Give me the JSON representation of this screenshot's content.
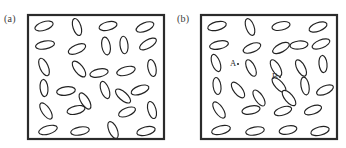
{
  "figure": {
    "type": "scientific-illustration",
    "background_color": "#ffffff",
    "frame_color": "#2b2b2b",
    "particle_fill": "#ffffff",
    "particle_stroke": "#222222",
    "label_color": "#3a3a3a"
  },
  "panels": [
    {
      "id": "a",
      "label": "(a)",
      "frame": {
        "x": 28,
        "y": 15,
        "width": 136,
        "height": 124
      },
      "particle_count": 28,
      "particles": [
        {
          "cx": 44,
          "cy": 26,
          "rx": 9.5,
          "ry": 4.2,
          "angle": -18
        },
        {
          "cx": 77,
          "cy": 27,
          "rx": 8.8,
          "ry": 4.0,
          "angle": 72
        },
        {
          "cx": 108,
          "cy": 26,
          "rx": 9.2,
          "ry": 4.1,
          "angle": -14
        },
        {
          "cx": 145,
          "cy": 27,
          "rx": 9.4,
          "ry": 4.2,
          "angle": -22
        },
        {
          "cx": 45,
          "cy": 45,
          "rx": 9.6,
          "ry": 4.0,
          "angle": -10
        },
        {
          "cx": 77,
          "cy": 49,
          "rx": 9.3,
          "ry": 4.2,
          "angle": -24
        },
        {
          "cx": 106,
          "cy": 46,
          "rx": 9.0,
          "ry": 4.2,
          "angle": 80
        },
        {
          "cx": 124,
          "cy": 45,
          "rx": 8.8,
          "ry": 4.0,
          "angle": 84
        },
        {
          "cx": 148,
          "cy": 44,
          "rx": 9.4,
          "ry": 4.1,
          "angle": -30
        },
        {
          "cx": 44,
          "cy": 67,
          "rx": 9.4,
          "ry": 4.1,
          "angle": 66
        },
        {
          "cx": 79,
          "cy": 69,
          "rx": 9.5,
          "ry": 4.2,
          "angle": 52
        },
        {
          "cx": 99,
          "cy": 73,
          "rx": 9.3,
          "ry": 4.0,
          "angle": -12
        },
        {
          "cx": 126,
          "cy": 71,
          "rx": 9.5,
          "ry": 4.1,
          "angle": -16
        },
        {
          "cx": 152,
          "cy": 68,
          "rx": 8.6,
          "ry": 4.0,
          "angle": 78
        },
        {
          "cx": 44,
          "cy": 88,
          "rx": 8.6,
          "ry": 3.9,
          "angle": 84
        },
        {
          "cx": 66,
          "cy": 91,
          "rx": 9.4,
          "ry": 4.2,
          "angle": -8
        },
        {
          "cx": 105,
          "cy": 90,
          "rx": 9.0,
          "ry": 4.0,
          "angle": 70
        },
        {
          "cx": 140,
          "cy": 90,
          "rx": 9.3,
          "ry": 4.1,
          "angle": -20
        },
        {
          "cx": 85,
          "cy": 101,
          "rx": 9.2,
          "ry": 4.0,
          "angle": 58
        },
        {
          "cx": 123,
          "cy": 96,
          "rx": 9.4,
          "ry": 4.1,
          "angle": 42
        },
        {
          "cx": 46,
          "cy": 111,
          "rx": 9.4,
          "ry": 4.1,
          "angle": 56
        },
        {
          "cx": 76,
          "cy": 110,
          "rx": 9.2,
          "ry": 4.0,
          "angle": -14
        },
        {
          "cx": 127,
          "cy": 112,
          "rx": 9.0,
          "ry": 4.0,
          "angle": -22
        },
        {
          "cx": 152,
          "cy": 110,
          "rx": 8.8,
          "ry": 4.0,
          "angle": 74
        },
        {
          "cx": 48,
          "cy": 130,
          "rx": 9.6,
          "ry": 4.1,
          "angle": -16
        },
        {
          "cx": 80,
          "cy": 131,
          "rx": 9.4,
          "ry": 4.0,
          "angle": -10
        },
        {
          "cx": 113,
          "cy": 130,
          "rx": 9.0,
          "ry": 4.1,
          "angle": 66
        },
        {
          "cx": 146,
          "cy": 131,
          "rx": 9.4,
          "ry": 4.1,
          "angle": -14
        }
      ],
      "annotations": []
    },
    {
      "id": "b",
      "label": "(b)",
      "frame": {
        "x": 28,
        "y": 15,
        "width": 136,
        "height": 124
      },
      "particle_count": 28,
      "particles": [
        {
          "cx": 44,
          "cy": 26,
          "rx": 9.5,
          "ry": 4.2,
          "angle": -14
        },
        {
          "cx": 77,
          "cy": 27,
          "rx": 8.8,
          "ry": 4.0,
          "angle": 70
        },
        {
          "cx": 108,
          "cy": 26,
          "rx": 9.2,
          "ry": 4.1,
          "angle": -12
        },
        {
          "cx": 145,
          "cy": 27,
          "rx": 9.4,
          "ry": 4.2,
          "angle": -20
        },
        {
          "cx": 46,
          "cy": 45,
          "rx": 9.6,
          "ry": 4.0,
          "angle": -12
        },
        {
          "cx": 79,
          "cy": 48,
          "rx": 9.3,
          "ry": 4.2,
          "angle": -22
        },
        {
          "cx": 108,
          "cy": 48,
          "rx": 9.2,
          "ry": 4.1,
          "angle": -28
        },
        {
          "cx": 126,
          "cy": 45,
          "rx": 9.0,
          "ry": 4.0,
          "angle": -6
        },
        {
          "cx": 148,
          "cy": 44,
          "rx": 9.4,
          "ry": 4.1,
          "angle": -22
        },
        {
          "cx": 43,
          "cy": 63,
          "rx": 9.0,
          "ry": 4.0,
          "angle": 70
        },
        {
          "cx": 78,
          "cy": 68,
          "rx": 9.0,
          "ry": 4.0,
          "angle": 64
        },
        {
          "cx": 103,
          "cy": 68,
          "rx": 9.2,
          "ry": 4.0,
          "angle": 60
        },
        {
          "cx": 128,
          "cy": 68,
          "rx": 9.0,
          "ry": 4.0,
          "angle": 62
        },
        {
          "cx": 150,
          "cy": 64,
          "rx": 8.6,
          "ry": 4.0,
          "angle": 84
        },
        {
          "cx": 44,
          "cy": 86,
          "rx": 8.6,
          "ry": 3.9,
          "angle": 82
        },
        {
          "cx": 65,
          "cy": 90,
          "rx": 9.4,
          "ry": 4.2,
          "angle": 52
        },
        {
          "cx": 106,
          "cy": 85,
          "rx": 9.4,
          "ry": 4.0,
          "angle": 48
        },
        {
          "cx": 132,
          "cy": 86,
          "rx": 9.0,
          "ry": 4.0,
          "angle": 80
        },
        {
          "cx": 152,
          "cy": 90,
          "rx": 9.0,
          "ry": 4.0,
          "angle": -24
        },
        {
          "cx": 86,
          "cy": 98,
          "rx": 9.2,
          "ry": 4.0,
          "angle": 56
        },
        {
          "cx": 116,
          "cy": 98,
          "rx": 9.4,
          "ry": 4.1,
          "angle": 50
        },
        {
          "cx": 46,
          "cy": 110,
          "rx": 9.4,
          "ry": 4.1,
          "angle": 56
        },
        {
          "cx": 78,
          "cy": 110,
          "rx": 9.2,
          "ry": 4.0,
          "angle": -12
        },
        {
          "cx": 110,
          "cy": 111,
          "rx": 9.0,
          "ry": 4.0,
          "angle": -18
        },
        {
          "cx": 140,
          "cy": 110,
          "rx": 9.0,
          "ry": 4.0,
          "angle": -20
        },
        {
          "cx": 48,
          "cy": 130,
          "rx": 9.6,
          "ry": 4.1,
          "angle": -14
        },
        {
          "cx": 82,
          "cy": 131,
          "rx": 9.4,
          "ry": 4.0,
          "angle": -10
        },
        {
          "cx": 115,
          "cy": 130,
          "rx": 9.0,
          "ry": 4.1,
          "angle": -12
        },
        {
          "cx": 147,
          "cy": 131,
          "rx": 9.4,
          "ry": 4.1,
          "angle": -14
        }
      ],
      "annotations": [
        {
          "id": "A",
          "text": "A",
          "x": 57,
          "y": 66,
          "dot_x": 65,
          "dot_y": 64
        },
        {
          "id": "B",
          "text": "B",
          "x": 99,
          "y": 79,
          "dot_x": 107,
          "dot_y": 77
        }
      ]
    }
  ]
}
